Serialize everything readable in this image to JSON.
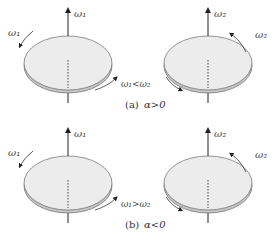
{
  "panels": [
    {
      "id": "a",
      "caption_label": "(a)",
      "caption_condition": "α>0",
      "relation": "ω₁<ω₂",
      "left_disc": {
        "axis_label": "ω₁",
        "rotation_label": "ω₁"
      },
      "right_disc": {
        "axis_label": "ω₂",
        "rotation_label": "ω₂"
      }
    },
    {
      "id": "b",
      "caption_label": "(b)",
      "caption_condition": "α<0",
      "relation": "ω₁>ω₂",
      "left_disc": {
        "axis_label": "ω₁",
        "rotation_label": "ω₁"
      },
      "right_disc": {
        "axis_label": "ω₂",
        "rotation_label": "ω₂"
      }
    }
  ],
  "colors": {
    "disc_fill": "#ececec",
    "disc_rim": "#bdbdbd",
    "outline": "#6a6a6a",
    "axis": "#222222"
  }
}
